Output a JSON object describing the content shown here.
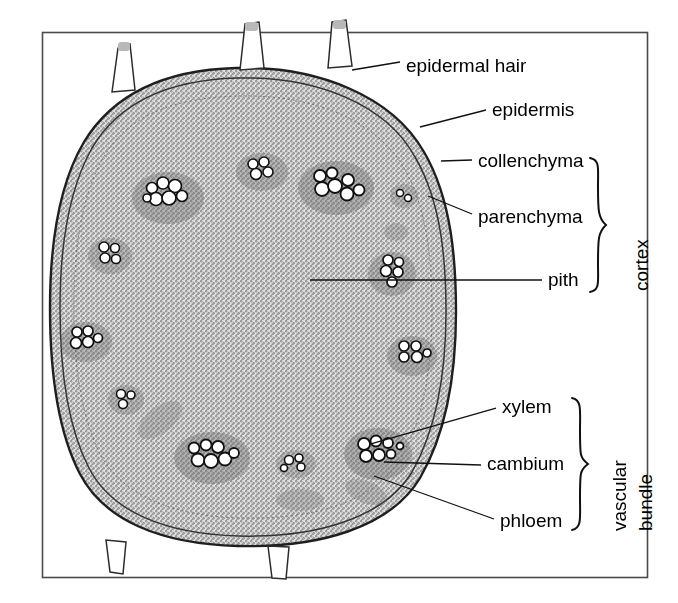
{
  "figure": {
    "kind": "light-micrograph-line-drawing",
    "frame": {
      "stroke": "#4a4a4a",
      "x": 42,
      "y": 32,
      "width": 606,
      "height": 546
    },
    "background": "#ffffff",
    "ink": "#1a1a1a"
  },
  "labels": [
    {
      "id": "epidermal-hair",
      "text": "epidermal hair",
      "x": 406,
      "y": 56,
      "leader": {
        "x1": 352,
        "y1": 70,
        "x2": 400,
        "y2": 62
      }
    },
    {
      "id": "epidermis",
      "text": "epidermis",
      "x": 492,
      "y": 100,
      "leader": {
        "x1": 420,
        "y1": 127,
        "x2": 486,
        "y2": 110
      }
    },
    {
      "id": "collenchyma",
      "text": "collenchyma",
      "x": 478,
      "y": 152,
      "leader": {
        "x1": 441,
        "y1": 161,
        "x2": 472,
        "y2": 160
      }
    },
    {
      "id": "parenchyma",
      "text": "parenchyma",
      "x": 478,
      "y": 208,
      "leader": {
        "x1": 428,
        "y1": 196,
        "x2": 472,
        "y2": 214
      }
    },
    {
      "id": "pith",
      "text": "pith",
      "x": 548,
      "y": 270,
      "leader": {
        "x1": 310,
        "y1": 280,
        "x2": 542,
        "y2": 280
      }
    },
    {
      "id": "xylem",
      "text": "xylem",
      "x": 502,
      "y": 398,
      "leader": {
        "x1": 432,
        "y1": 428,
        "x2": 496,
        "y2": 408
      }
    },
    {
      "id": "cambium",
      "text": "cambium",
      "x": 487,
      "y": 455,
      "leader": {
        "x1": 428,
        "y1": 470,
        "x2": 481,
        "y2": 465
      }
    },
    {
      "id": "phloem",
      "text": "phloem",
      "x": 500,
      "y": 512,
      "leader": {
        "x1": 421,
        "y1": 478,
        "x2": 494,
        "y2": 519
      }
    }
  ],
  "braces": [
    {
      "id": "cortex",
      "label": "cortex",
      "x": 596,
      "y_top": 158,
      "y_bottom": 292,
      "label_x": 636,
      "label_y": 288
    },
    {
      "id": "vascular-bundle",
      "label_line_1": "vascular",
      "label_line_2": "bundle",
      "x": 578,
      "y_top": 398,
      "y_bottom": 530,
      "label_x_1": 614,
      "label_y_1": 528,
      "label_x_2": 640,
      "label_y_2": 528
    }
  ],
  "structures": {
    "stem_outline": "rounded octagonal cross-section",
    "epidermal_hairs_top": 3,
    "epidermal_hairs_bottom": 2,
    "vascular_bundles": 12,
    "pith_region": "large central thin-walled parenchyma cells",
    "cortex_region": "narrow outer band between epidermis and vascular ring"
  }
}
